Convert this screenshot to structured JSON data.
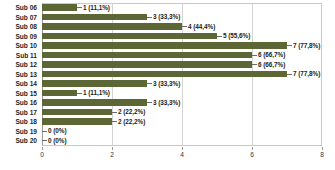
{
  "chart_data": {
    "type": "bar",
    "orientation": "horizontal",
    "title": "",
    "xlabel": "",
    "ylabel": "",
    "xlim": [
      0,
      8
    ],
    "xticks": [
      "0",
      "2",
      "4",
      "6",
      "8"
    ],
    "grid": true,
    "legend": false,
    "series_color": "#5d6635",
    "categories": [
      "Sub 06",
      "Sub 07",
      "Sub 08",
      "Sub 09",
      "Sub 10",
      "Sub 11",
      "Sub 12",
      "Sub 13",
      "Sub 14",
      "Sub 15",
      "Sub 16",
      "Sub 17",
      "Sub 18",
      "Sub 19",
      "Sub 20"
    ],
    "values": [
      1,
      3,
      4,
      5,
      7,
      6,
      6,
      7,
      3,
      1,
      3,
      2,
      2,
      0,
      0
    ],
    "percent_labels": [
      "11,1%",
      "33,3%",
      "44,4%",
      "55,6%",
      "77,8%",
      "66,7%",
      "66,7%",
      "77,8%",
      "33,3%",
      "11,1%",
      "33,3%",
      "22,2%",
      "22,2%",
      "0%",
      "0%"
    ],
    "data_labels": [
      "1 (11,1%)",
      "3 (33,3%)",
      "4 (44,4%)",
      "5 (55,6%)",
      "7 (77,8%)",
      "6 (66,7%)",
      "6 (66,7%)",
      "7 (77,8%)",
      "3 (33,3%)",
      "1 (11,1%)",
      "3 (33,3%)",
      "2 (22,2%)",
      "2 (22,2%)",
      "0 (0%)",
      "0 (0%)"
    ]
  }
}
